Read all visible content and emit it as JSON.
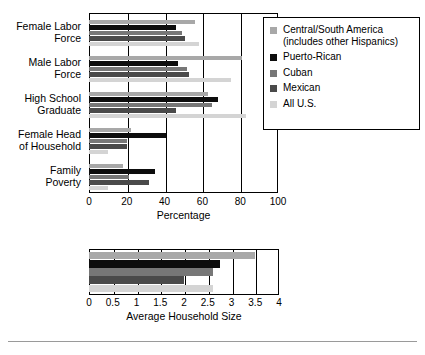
{
  "legend": {
    "items": [
      {
        "label": "Central/South America\n(includes other Hispanics)",
        "color": "#a8a8a8"
      },
      {
        "label": "Puerto-Rican",
        "color": "#0d0d0d"
      },
      {
        "label": "Cuban",
        "color": "#777777"
      },
      {
        "label": "Mexican",
        "color": "#4a4a4a"
      },
      {
        "label": "All U.S.",
        "color": "#d4d4d4"
      }
    ]
  },
  "chart_data": [
    {
      "type": "bar",
      "orientation": "horizontal",
      "title": "",
      "xlabel": "Percentage",
      "ylabel": "",
      "xlim": [
        0,
        100
      ],
      "xticks": [
        "0",
        "20",
        "40",
        "60",
        "80",
        "100"
      ],
      "xtick_values": [
        0,
        20,
        40,
        60,
        80,
        100
      ],
      "grid": true,
      "legend_position": "right",
      "categories": [
        "Female Labor\nForce",
        "Male Labor\nForce",
        "High School\nGraduate",
        "Female Head\nof Household",
        "Family\nPoverty"
      ],
      "series": [
        {
          "name": "Central/South America (includes other Hispanics)",
          "color": "#a8a8a8",
          "values": [
            56,
            81,
            63,
            22,
            18
          ]
        },
        {
          "name": "Puerto-Rican",
          "color": "#0d0d0d",
          "values": [
            46,
            47,
            68,
            41,
            35
          ]
        },
        {
          "name": "Cuban",
          "color": "#777777",
          "values": [
            49,
            52,
            65,
            20,
            21
          ]
        },
        {
          "name": "Mexican",
          "color": "#4a4a4a",
          "values": [
            51,
            53,
            46,
            20,
            32
          ]
        },
        {
          "name": "All U.S.",
          "color": "#d4d4d4",
          "values": [
            58,
            75,
            83,
            10,
            10
          ]
        }
      ]
    },
    {
      "type": "bar",
      "orientation": "horizontal",
      "title": "",
      "xlabel": "Average Household Size",
      "ylabel": "",
      "xlim": [
        0,
        4
      ],
      "xticks": [
        "0",
        "0.5",
        "1",
        "1.5",
        "2",
        "2.5",
        "3",
        "3.5",
        "4"
      ],
      "xtick_values": [
        0,
        0.5,
        1,
        1.5,
        2,
        2.5,
        3,
        3.5,
        4
      ],
      "grid": true,
      "legend_position": "none",
      "categories": [
        "Average Household Size"
      ],
      "series": [
        {
          "name": "Central/South America (includes other Hispanics)",
          "color": "#a8a8a8",
          "values": [
            3.5
          ]
        },
        {
          "name": "Puerto-Rican",
          "color": "#0d0d0d",
          "values": [
            2.75
          ]
        },
        {
          "name": "Cuban",
          "color": "#777777",
          "values": [
            2.6
          ]
        },
        {
          "name": "Mexican",
          "color": "#4a4a4a",
          "values": [
            2.0
          ]
        },
        {
          "name": "All U.S.",
          "color": "#d4d4d4",
          "values": [
            2.6
          ]
        }
      ]
    }
  ]
}
